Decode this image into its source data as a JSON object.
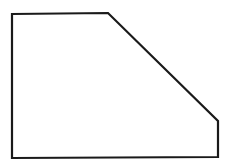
{
  "figure": {
    "shape": "pentagon",
    "stroke_color": "#1a1a1a",
    "fill_color": "#ffffff",
    "background": "#ffffff",
    "stroke_width": 2.2,
    "points": [
      [
        12,
        14
      ],
      [
        108,
        13
      ],
      [
        218,
        121
      ],
      [
        218,
        157
      ],
      [
        12,
        158
      ]
    ]
  }
}
